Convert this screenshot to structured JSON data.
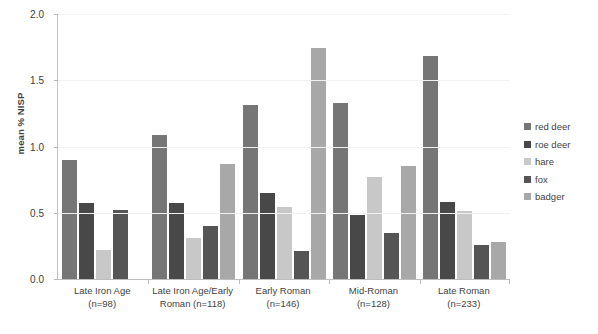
{
  "chart_data": {
    "type": "bar",
    "title": "",
    "xlabel": "",
    "ylabel": "mean % NISP",
    "ylim": [
      0.0,
      2.0
    ],
    "ytick_values": [
      0.0,
      0.5,
      1.0,
      1.5,
      2.0
    ],
    "ytick_labels": [
      "0.0",
      "0.5",
      "1.0",
      "1.5",
      "2.0"
    ],
    "grid": true,
    "legend_position": "right",
    "categories": [
      "Late Iron Age (n=98)",
      "Late Iron Age/Early Roman (n=118)",
      "Early Roman (n=146)",
      "Mid-Roman (n=128)",
      "Late Roman (n=233)"
    ],
    "category_lines": [
      {
        "line1": "Late Iron Age",
        "line2": "(n=98)"
      },
      {
        "line1": "Late Iron Age/Early",
        "line2": "Roman (n=118)"
      },
      {
        "line1": "Early Roman",
        "line2": "(n=146)"
      },
      {
        "line1": "Mid-Roman",
        "line2": "(n=128)"
      },
      {
        "line1": "Late Roman",
        "line2": "(n=233)"
      }
    ],
    "series": [
      {
        "name": "red deer",
        "color": "#767676",
        "values": [
          0.9,
          1.09,
          1.31,
          1.33,
          1.68
        ]
      },
      {
        "name": "roe deer",
        "color": "#484848",
        "values": [
          0.57,
          0.57,
          0.65,
          0.48,
          0.58
        ]
      },
      {
        "name": "hare",
        "color": "#c8c8c8",
        "values": [
          0.22,
          0.31,
          0.54,
          0.77,
          0.51
        ]
      },
      {
        "name": "fox",
        "color": "#555555",
        "values": [
          0.52,
          0.4,
          0.21,
          0.35,
          0.26
        ]
      },
      {
        "name": "badger",
        "color": "#a8a8a8",
        "values": [
          null,
          0.87,
          1.74,
          0.85,
          0.28
        ]
      }
    ]
  },
  "legend": {
    "items": [
      {
        "label": "red deer",
        "color": "#767676"
      },
      {
        "label": "roe deer",
        "color": "#484848"
      },
      {
        "label": "hare",
        "color": "#c8c8c8"
      },
      {
        "label": "fox",
        "color": "#555555"
      },
      {
        "label": "badger",
        "color": "#a8a8a8"
      }
    ]
  }
}
